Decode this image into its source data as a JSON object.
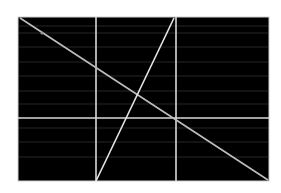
{
  "figure": {
    "background": "#ffffff",
    "panel": {
      "x": 18,
      "y": 17,
      "width": 251,
      "height": 164,
      "fill": "#000000",
      "stroke": "#cfcfcf"
    },
    "faint_rules_y": [
      26,
      33,
      47,
      62,
      76,
      91,
      104,
      128,
      142,
      157
    ],
    "faint_rule_color": "#262626",
    "lines": [
      {
        "name": "vertical-divider-1",
        "x1": 96,
        "y1": 17,
        "x2": 96,
        "y2": 181,
        "color": "#d9d9d9"
      },
      {
        "name": "vertical-divider-2",
        "x1": 176,
        "y1": 17,
        "x2": 176,
        "y2": 181,
        "color": "#d9d9d9"
      },
      {
        "name": "horizontal-divider",
        "x1": 18,
        "y1": 118,
        "x2": 269,
        "y2": 118,
        "color": "#d9d9d9"
      },
      {
        "name": "descending-diagonal",
        "x1": 20,
        "y1": 18,
        "x2": 268,
        "y2": 180,
        "color": "#bdbdbd"
      },
      {
        "name": "ascending-diagonal",
        "x1": 96,
        "y1": 181,
        "x2": 174,
        "y2": 18,
        "color": "#e6e6e6"
      }
    ],
    "marker": {
      "x": 42,
      "y": 33,
      "r": 1.5,
      "color": "#9a9a9a"
    }
  }
}
